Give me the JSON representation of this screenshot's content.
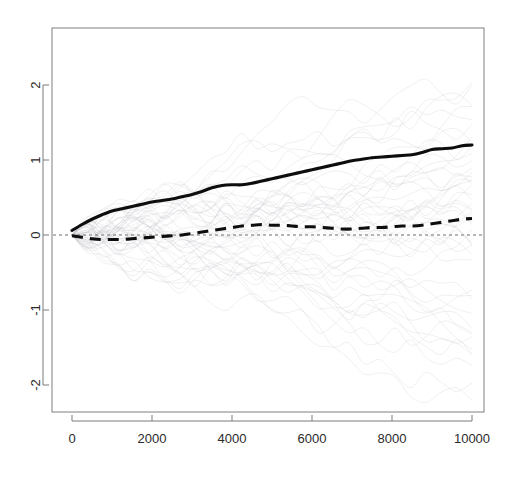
{
  "chart_data": {
    "type": "line",
    "title": "",
    "subtitle": "",
    "xlabel": "",
    "ylabel": "",
    "xlim": [
      -600,
      10600
    ],
    "ylim": [
      -2.62,
      2.66
    ],
    "grid": false,
    "legend": "none",
    "background": "#ffffff",
    "foreground": "#0d0d0d",
    "faint_color": "#b9b9c2",
    "x_ticks": [
      0,
      2000,
      4000,
      6000,
      8000,
      10000
    ],
    "x_tick_labels": [
      "0",
      "2000",
      "4000",
      "6000",
      "8000",
      "10000"
    ],
    "y_ticks": [
      -2,
      -1,
      0,
      1,
      2
    ],
    "y_tick_labels": [
      "-2",
      "-1",
      "0",
      "1",
      "2"
    ],
    "y_tick_labels_rotated": true,
    "reference_line": {
      "y": 0,
      "style": "dashed",
      "color": "#6e6e6e"
    },
    "x": [
      0,
      250,
      500,
      750,
      1000,
      1250,
      1500,
      1750,
      2000,
      2250,
      2500,
      2750,
      3000,
      3250,
      3500,
      3750,
      4000,
      4250,
      4500,
      4750,
      5000,
      5250,
      5500,
      5750,
      6000,
      6250,
      6500,
      6750,
      7000,
      7250,
      7500,
      7750,
      8000,
      8250,
      8500,
      8750,
      9000,
      9250,
      9500,
      9750,
      10000
    ],
    "series": [
      {
        "name": "mean-trajectory-solid",
        "style": "solid",
        "color": "#0d0d0d",
        "values": [
          0.06,
          0.14,
          0.21,
          0.27,
          0.32,
          0.35,
          0.38,
          0.41,
          0.44,
          0.46,
          0.48,
          0.51,
          0.54,
          0.58,
          0.63,
          0.66,
          0.67,
          0.67,
          0.69,
          0.72,
          0.75,
          0.78,
          0.81,
          0.84,
          0.87,
          0.9,
          0.93,
          0.96,
          0.99,
          1.01,
          1.03,
          1.04,
          1.05,
          1.06,
          1.07,
          1.1,
          1.14,
          1.15,
          1.16,
          1.19,
          1.2
        ]
      },
      {
        "name": "median-trajectory-dashed",
        "style": "dashed",
        "color": "#0d0d0d",
        "values": [
          -0.01,
          -0.03,
          -0.05,
          -0.06,
          -0.06,
          -0.06,
          -0.05,
          -0.04,
          -0.03,
          -0.02,
          -0.01,
          0.0,
          0.02,
          0.04,
          0.06,
          0.08,
          0.1,
          0.12,
          0.13,
          0.14,
          0.13,
          0.13,
          0.12,
          0.11,
          0.11,
          0.1,
          0.09,
          0.08,
          0.08,
          0.09,
          0.1,
          0.1,
          0.11,
          0.12,
          0.12,
          0.13,
          0.15,
          0.17,
          0.19,
          0.21,
          0.22
        ]
      }
    ],
    "background_paths": {
      "name": "individual-sample-trajectories",
      "count": 48,
      "description": "faint light-gray random-walk trajectories fanning out from the origin",
      "color": "#b9b9c2",
      "opacity": 0.38
    }
  },
  "geometry": {
    "plot_left": 52,
    "plot_top": 28,
    "plot_right": 484,
    "plot_bottom": 412,
    "x_zero_px": 72,
    "x_max_px": 472,
    "y_zero_px": 235,
    "y_unit_px": 75
  }
}
